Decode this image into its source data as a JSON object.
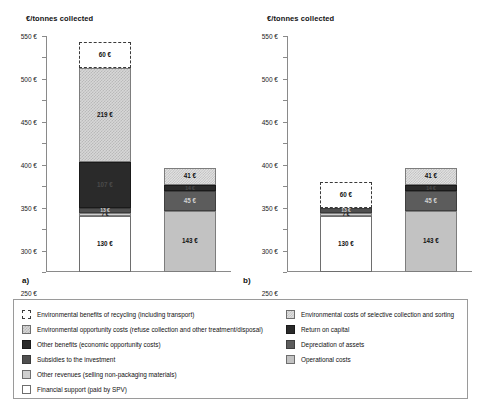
{
  "chart_data": {
    "type": "bar",
    "title": "",
    "ylabel": "€/tonnes collected",
    "xlabel": "",
    "ylim": [
      0,
      550
    ],
    "ytick_step": 50,
    "ytick_labels": [
      "0 €",
      "50 €",
      "100 €",
      "150 €",
      "200 €",
      "250 €",
      "300 €",
      "350 €",
      "400 €",
      "450 €",
      "500 €",
      "550 €"
    ],
    "grid": false,
    "legend_position": "bottom",
    "stacked": true,
    "panels": [
      {
        "label": "a)",
        "bars": [
          {
            "name": "benefits-bar",
            "total": 486,
            "segments": [
              {
                "key": "financial_support",
                "value": 130,
                "label": "130 €",
                "fill": "white"
              },
              {
                "key": "other_revenues",
                "value": 7,
                "label": "7 €",
                "fill": "lightgray"
              },
              {
                "key": "subsidies",
                "value": 13,
                "label": "13 €",
                "fill": "darkgray"
              },
              {
                "key": "other_benefits",
                "value": 107,
                "label": "107 €",
                "fill": "black"
              },
              {
                "key": "env_opportunity_costs",
                "value": 219,
                "label": "219 €",
                "fill": "checker"
              },
              {
                "key": "env_benefits_recycling",
                "value": 60,
                "label": "60 €",
                "fill": "dashed"
              }
            ]
          },
          {
            "name": "costs-bar",
            "total": 243,
            "segments": [
              {
                "key": "operational_costs",
                "value": 143,
                "label": "143 €",
                "fill": "gray"
              },
              {
                "key": "depreciation",
                "value": 45,
                "label": "45 €",
                "fill": "midgray"
              },
              {
                "key": "return_on_capital",
                "value": 14,
                "label": "14 €",
                "fill": "black"
              },
              {
                "key": "env_costs_selective",
                "value": 41,
                "label": "41 €",
                "fill": "checker2"
              }
            ]
          }
        ]
      },
      {
        "label": "b)",
        "bars": [
          {
            "name": "benefits-bar",
            "total": 210,
            "segments": [
              {
                "key": "financial_support",
                "value": 130,
                "label": "130 €",
                "fill": "white"
              },
              {
                "key": "other_revenues",
                "value": 7,
                "label": "7 €",
                "fill": "lightgray"
              },
              {
                "key": "subsidies",
                "value": 13,
                "label": "13 €",
                "fill": "darkgray"
              },
              {
                "key": "env_benefits_recycling",
                "value": 60,
                "label": "60 €",
                "fill": "dashed"
              }
            ]
          },
          {
            "name": "costs-bar",
            "total": 243,
            "segments": [
              {
                "key": "operational_costs",
                "value": 143,
                "label": "143 €",
                "fill": "gray"
              },
              {
                "key": "depreciation",
                "value": 45,
                "label": "45 €",
                "fill": "midgray"
              },
              {
                "key": "return_on_capital",
                "value": 14,
                "label": "14 €",
                "fill": "black"
              },
              {
                "key": "env_costs_selective",
                "value": 41,
                "label": "41 €",
                "fill": "checker2"
              }
            ]
          }
        ]
      }
    ],
    "legend": {
      "left_column": [
        {
          "swatch": "dashed",
          "label": "Environmental benefits of recycling (including transport)"
        },
        {
          "swatch": "checker",
          "label": "Environmental opportunity costs (refuse collection and other treatment/disposal)"
        },
        {
          "swatch": "black",
          "label": "Other benefits (economic opportunity costs)"
        },
        {
          "swatch": "darkgray",
          "label": "Subsidies to the investment"
        },
        {
          "swatch": "lightgray",
          "label": "Other revenues (selling non-packaging materials)"
        },
        {
          "swatch": "white",
          "label": "Financial support (paid by SPV)"
        }
      ],
      "right_column": [
        {
          "swatch": "checker2",
          "label": "Environmental costs of selective collection and sorting"
        },
        {
          "swatch": "black",
          "label": "Return on capital"
        },
        {
          "swatch": "midgray",
          "label": "Depreciation of assets"
        },
        {
          "swatch": "gray",
          "label": "Operational costs"
        }
      ]
    }
  }
}
